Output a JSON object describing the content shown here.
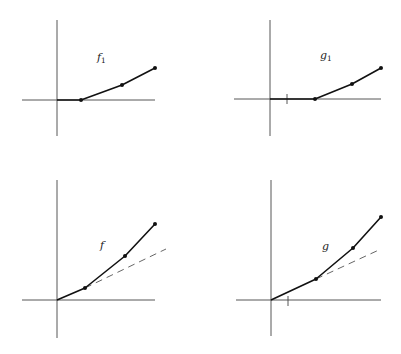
{
  "panels": [
    {
      "id": "f1",
      "label": "f",
      "subscript": "1",
      "label_pos": [
        97,
        61
      ],
      "axes": {
        "origin": [
          57,
          100
        ],
        "x_range": [
          22,
          155
        ],
        "y_range": [
          20,
          136
        ]
      },
      "tick": null,
      "points": [
        [
          57,
          100
        ],
        [
          81,
          100
        ],
        [
          122,
          85
        ],
        [
          155,
          68
        ]
      ],
      "dots": [
        [
          81,
          100
        ],
        [
          122,
          85
        ],
        [
          155,
          68
        ]
      ],
      "dashed": null
    },
    {
      "id": "g1",
      "label": "g",
      "subscript": "1",
      "label_pos": [
        320,
        59
      ],
      "axes": {
        "origin": [
          270,
          99
        ],
        "x_range": [
          234,
          381
        ],
        "y_range": [
          20,
          136
        ]
      },
      "tick": [
        287,
        99
      ],
      "points": [
        [
          270,
          99
        ],
        [
          315,
          99
        ],
        [
          352,
          84
        ],
        [
          381,
          68
        ]
      ],
      "dots": [
        [
          315,
          99
        ],
        [
          352,
          84
        ],
        [
          381,
          68
        ]
      ],
      "dashed": null
    },
    {
      "id": "f",
      "label": "f",
      "subscript": "",
      "label_pos": [
        100,
        249
      ],
      "axes": {
        "origin": [
          57,
          300
        ],
        "x_range": [
          22,
          155
        ],
        "y_range": [
          180,
          338
        ]
      },
      "tick": null,
      "points": [
        [
          57,
          300
        ],
        [
          85,
          288
        ],
        [
          125,
          256
        ],
        [
          155,
          224
        ]
      ],
      "dots": [
        [
          85,
          288
        ],
        [
          125,
          256
        ],
        [
          155,
          224
        ]
      ],
      "dashed": [
        [
          85,
          288
        ],
        [
          166,
          249
        ]
      ]
    },
    {
      "id": "g",
      "label": "g",
      "subscript": "",
      "label_pos": [
        322,
        250
      ],
      "axes": {
        "origin": [
          271,
          300
        ],
        "x_range": [
          236,
          381
        ],
        "y_range": [
          180,
          336
        ]
      },
      "tick": [
        288,
        300
      ],
      "points": [
        [
          271,
          300
        ],
        [
          316,
          279
        ],
        [
          353,
          248
        ],
        [
          381,
          217
        ]
      ],
      "dots": [
        [
          316,
          279
        ],
        [
          353,
          248
        ],
        [
          381,
          217
        ]
      ],
      "dashed": [
        [
          316,
          279
        ],
        [
          381,
          249
        ]
      ]
    }
  ],
  "labels": {
    "f1": "f",
    "f1_sub": "1",
    "g1": "g",
    "g1_sub": "1",
    "f": "f",
    "g": "g"
  }
}
